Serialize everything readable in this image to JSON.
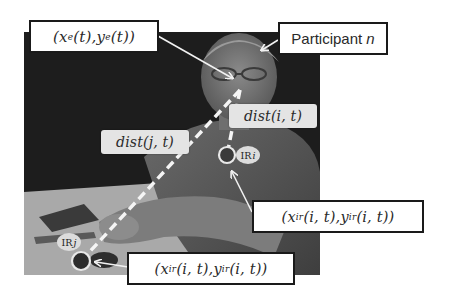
{
  "figure": {
    "labels": {
      "eye_position": {
        "open": "(",
        "x": "x",
        "x_sub": "e",
        "xt": "(t)",
        "sep": ", ",
        "y": "y",
        "y_sub": "e",
        "yt": "(t)",
        "close": ")"
      },
      "participant": {
        "text": "Participant ",
        "var": "n"
      },
      "dist_i": {
        "fn": "dist",
        "args": "(i, t)"
      },
      "dist_j": {
        "fn": "dist",
        "args": "(j, t)"
      },
      "ir_i": {
        "text": "IR",
        "var": "i"
      },
      "ir_j": {
        "text": "IR",
        "var": "j"
      },
      "ir_position_i": {
        "open": "(",
        "x": "x",
        "x_sub": "ir",
        "xt": "(i, t)",
        "sep": ", ",
        "y": "y",
        "y_sub": "ir",
        "yt": "(i, t)",
        "close": ")"
      },
      "ir_position_j": {
        "open": "(",
        "x": "x",
        "x_sub": "ir",
        "xt": "(i, t)",
        "sep": ", ",
        "y": "y",
        "y_sub": "ir",
        "yt": "(i, t)",
        "close": ")"
      }
    },
    "colors": {
      "background": "#ffffff",
      "photo_dark": "#1e1e1e",
      "label_border": "#1a1a1a",
      "dashed_line": "#f5f5f5",
      "dist_box": "#e4e4e4"
    }
  }
}
